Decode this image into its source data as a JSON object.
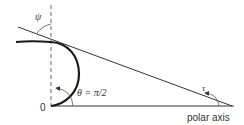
{
  "diagram": {
    "type": "polar-tangent-angle",
    "labels": {
      "psi": "ψ",
      "theta_eq": "θ = π/2",
      "tau": "τ",
      "origin": "0",
      "polar_axis": "polar axis"
    },
    "colors": {
      "line": "#333333",
      "curve": "#1a1a1a",
      "dashed": "#666666",
      "background": "#ffffff"
    }
  }
}
